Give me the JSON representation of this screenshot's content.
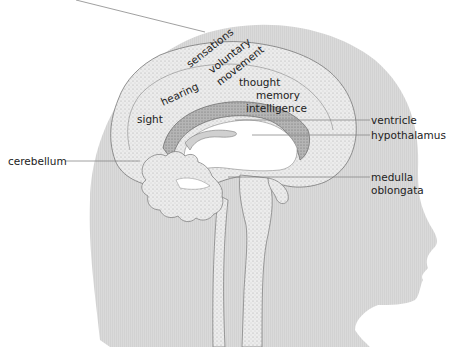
{
  "diagram": {
    "type": "anatomical cross-section",
    "colors": {
      "head_fill": "#d9d9d9",
      "brain_fill": "#e8e8e8",
      "brain_outline": "#777777",
      "corpus_fill": "#b8b8b8",
      "leader_line": "#888888",
      "text": "#222222"
    },
    "brain_area_labels": {
      "sensations": "sensations",
      "voluntary": "voluntary",
      "movement": "movement",
      "hearing": "hearing",
      "thought": "thought",
      "memory": "memory",
      "intelligence": "intelligence",
      "sight": "sight"
    },
    "callouts": {
      "ventricle": "ventricle",
      "hypothalamus": "hypothalamus",
      "cerebellum": "cerebellum",
      "medulla_line1": "medulla",
      "medulla_line2": "oblongata"
    }
  }
}
